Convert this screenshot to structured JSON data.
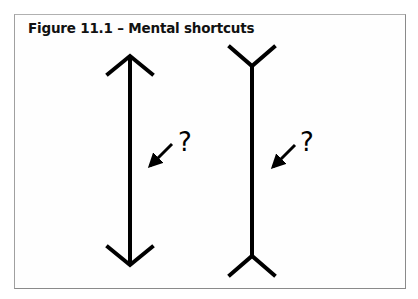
{
  "figure": {
    "title": "Figure 11.1 – Mental shortcuts",
    "left_figure": {
      "type": "line-with-inward-arrowheads",
      "question_mark": "?"
    },
    "right_figure": {
      "type": "line-with-outward-fins",
      "question_mark": "?"
    }
  }
}
